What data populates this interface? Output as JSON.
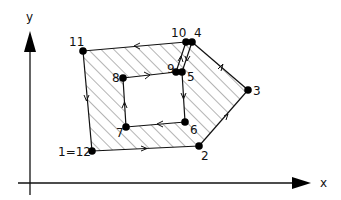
{
  "diagram": {
    "axes": {
      "x_label": "x",
      "y_label": "y"
    },
    "points": [
      {
        "id": "1=12",
        "label": "1=12",
        "x": 92,
        "y": 151
      },
      {
        "id": "2",
        "label": "2",
        "x": 199,
        "y": 146
      },
      {
        "id": "3",
        "label": "3",
        "x": 248,
        "y": 90
      },
      {
        "id": "4",
        "label": "4",
        "x": 192,
        "y": 42
      },
      {
        "id": "5",
        "label": "5",
        "x": 182,
        "y": 72
      },
      {
        "id": "6",
        "label": "6",
        "x": 185,
        "y": 122
      },
      {
        "id": "7",
        "label": "7",
        "x": 126,
        "y": 127
      },
      {
        "id": "8",
        "label": "8",
        "x": 123,
        "y": 78
      },
      {
        "id": "9",
        "label": "9",
        "x": 176,
        "y": 72
      },
      {
        "id": "10",
        "label": "10",
        "x": 186,
        "y": 42
      },
      {
        "id": "11",
        "label": "11",
        "x": 83,
        "y": 51
      }
    ],
    "path_order": [
      "1=12",
      "2",
      "3",
      "4",
      "5",
      "6",
      "7",
      "8",
      "9",
      "10",
      "11",
      "1=12"
    ],
    "colors": {
      "stroke": "#111111",
      "hatch": "#333333",
      "background": "#ffffff"
    }
  }
}
